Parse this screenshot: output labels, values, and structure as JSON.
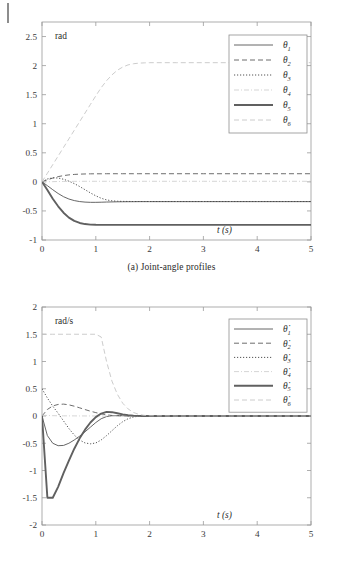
{
  "figure": {
    "panels": [
      {
        "id": "a",
        "caption": "(a) Joint-angle profiles",
        "unit_label": "rad",
        "x_axis_label": "t (s)",
        "y_ticks": [
          "2.5",
          "2",
          "1.5",
          "1",
          "0.5",
          "0",
          "-0.5",
          "-1"
        ],
        "x_ticks": [
          "0",
          "1",
          "2",
          "3",
          "4",
          "5"
        ],
        "legend": [
          {
            "label": "θ",
            "sub": "1",
            "style": "solid",
            "weight": "thin",
            "color": "#4d4d4d"
          },
          {
            "label": "θ",
            "sub": "2",
            "style": "dashed",
            "weight": "thin",
            "color": "#5a5a5a"
          },
          {
            "label": "θ",
            "sub": "3",
            "style": "dotted",
            "weight": "thin",
            "color": "#4a4a4a"
          },
          {
            "label": "θ",
            "sub": "4",
            "style": "dashdot",
            "weight": "thin",
            "color": "#c9c9c9"
          },
          {
            "label": "θ",
            "sub": "5",
            "style": "solid",
            "weight": "thick",
            "color": "#5e5e5e"
          },
          {
            "label": "θ",
            "sub": "6",
            "style": "dashed",
            "weight": "thin",
            "color": "#c4c4c4"
          }
        ]
      },
      {
        "id": "b",
        "caption": "(b) Joint-velocity profiles",
        "unit_label": "rad/s",
        "x_axis_label": "t (s)",
        "y_ticks": [
          "2",
          "1.5",
          "1",
          "0.5",
          "0",
          "-0.5",
          "-1",
          "-1.5",
          "-2"
        ],
        "x_ticks": [
          "0",
          "1",
          "2",
          "3",
          "4",
          "5"
        ],
        "legend": [
          {
            "label": "θ̇",
            "sub": "1",
            "style": "solid",
            "weight": "thin",
            "color": "#4d4d4d"
          },
          {
            "label": "θ̇",
            "sub": "2",
            "style": "dashed",
            "weight": "thin",
            "color": "#5a5a5a"
          },
          {
            "label": "θ̇",
            "sub": "3",
            "style": "dotted",
            "weight": "thin",
            "color": "#4a4a4a"
          },
          {
            "label": "θ̇",
            "sub": "4",
            "style": "dashdot",
            "weight": "thin",
            "color": "#c9c9c9"
          },
          {
            "label": "θ̇",
            "sub": "5",
            "style": "solid",
            "weight": "thick",
            "color": "#5e5e5e"
          },
          {
            "label": "θ̇",
            "sub": "6",
            "style": "dashed",
            "weight": "thin",
            "color": "#c4c4c4"
          }
        ]
      }
    ]
  },
  "chart_data": [
    {
      "type": "line",
      "title": "(a) Joint-angle profiles",
      "xlabel": "t (s)",
      "ylabel": "rad",
      "xlim": [
        0,
        5
      ],
      "ylim": [
        -1,
        2.75
      ],
      "grid": false,
      "legend_position": "upper-right",
      "x": [
        0,
        0.1,
        0.2,
        0.3,
        0.4,
        0.5,
        0.6,
        0.7,
        0.8,
        0.9,
        1.0,
        1.1,
        1.2,
        1.3,
        1.4,
        1.5,
        1.6,
        1.7,
        1.8,
        1.9,
        2.0,
        2.5,
        3.0,
        3.5,
        4.0,
        4.5,
        5.0
      ],
      "series": [
        {
          "name": "θ1",
          "style": "solid",
          "values": [
            0,
            -0.065,
            -0.135,
            -0.2,
            -0.255,
            -0.295,
            -0.322,
            -0.339,
            -0.348,
            -0.352,
            -0.352,
            -0.35,
            -0.347,
            -0.345,
            -0.343,
            -0.342,
            -0.341,
            -0.341,
            -0.34,
            -0.34,
            -0.34,
            -0.34,
            -0.34,
            -0.34,
            -0.34,
            -0.34,
            -0.34
          ]
        },
        {
          "name": "θ2",
          "style": "dashed",
          "values": [
            0,
            0.035,
            0.065,
            0.09,
            0.108,
            0.12,
            0.128,
            0.133,
            0.136,
            0.138,
            0.139,
            0.139,
            0.14,
            0.14,
            0.14,
            0.14,
            0.14,
            0.14,
            0.14,
            0.14,
            0.14,
            0.14,
            0.14,
            0.14,
            0.14,
            0.14,
            0.14
          ]
        },
        {
          "name": "θ3",
          "style": "dotted",
          "values": [
            0,
            0.05,
            0.07,
            0.066,
            0.045,
            0.012,
            -0.03,
            -0.08,
            -0.135,
            -0.19,
            -0.24,
            -0.282,
            -0.31,
            -0.326,
            -0.333,
            -0.336,
            -0.337,
            -0.338,
            -0.338,
            -0.338,
            -0.338,
            -0.338,
            -0.338,
            -0.338,
            -0.338,
            -0.338,
            -0.338
          ]
        },
        {
          "name": "θ4",
          "style": "dashdot",
          "values": [
            0,
            0.002,
            0.004,
            0.006,
            0.007,
            0.008,
            0.009,
            0.009,
            0.01,
            0.01,
            0.01,
            0.01,
            0.01,
            0.01,
            0.01,
            0.01,
            0.01,
            0.01,
            0.01,
            0.01,
            0.01,
            0.01,
            0.01,
            0.01,
            0.01,
            0.01,
            0.01
          ]
        },
        {
          "name": "θ5",
          "style": "solid-thick",
          "values": [
            0,
            -0.14,
            -0.29,
            -0.42,
            -0.53,
            -0.615,
            -0.672,
            -0.707,
            -0.726,
            -0.735,
            -0.738,
            -0.739,
            -0.739,
            -0.739,
            -0.739,
            -0.739,
            -0.739,
            -0.739,
            -0.739,
            -0.739,
            -0.739,
            -0.739,
            -0.739,
            -0.739,
            -0.739,
            -0.739,
            -0.739
          ]
        },
        {
          "name": "θ6",
          "style": "dashed-light",
          "values": [
            0,
            0.148,
            0.296,
            0.444,
            0.592,
            0.74,
            0.888,
            1.036,
            1.184,
            1.332,
            1.48,
            1.62,
            1.74,
            1.84,
            1.92,
            1.975,
            2.012,
            2.032,
            2.042,
            2.047,
            2.05,
            2.05,
            2.05,
            2.05,
            2.05,
            2.05,
            2.05
          ]
        }
      ]
    },
    {
      "type": "line",
      "title": "(b) Joint-velocity profiles",
      "xlabel": "t (s)",
      "ylabel": "rad/s",
      "xlim": [
        0,
        5
      ],
      "ylim": [
        -2,
        2
      ],
      "grid": false,
      "legend_position": "upper-right",
      "x": [
        0,
        0.1,
        0.2,
        0.3,
        0.4,
        0.5,
        0.6,
        0.7,
        0.8,
        0.9,
        1.0,
        1.1,
        1.2,
        1.3,
        1.4,
        1.5,
        1.6,
        1.7,
        1.8,
        1.9,
        2.0,
        2.5,
        3.0,
        3.5,
        4.0,
        4.5,
        5.0
      ],
      "series": [
        {
          "name": "θ̇1",
          "style": "solid",
          "values": [
            0,
            -0.36,
            -0.5,
            -0.545,
            -0.54,
            -0.5,
            -0.44,
            -0.37,
            -0.29,
            -0.205,
            -0.12,
            -0.05,
            -0.01,
            0.005,
            0.008,
            0.006,
            0.004,
            0.002,
            0.001,
            0.0,
            0.0,
            0.0,
            0.0,
            0.0,
            0.0,
            0.0,
            0.0
          ]
        },
        {
          "name": "θ̇2",
          "style": "dashed",
          "values": [
            0,
            0.12,
            0.185,
            0.212,
            0.218,
            0.205,
            0.18,
            0.15,
            0.118,
            0.088,
            0.062,
            0.04,
            0.022,
            0.01,
            0.004,
            0.001,
            0.0,
            0.0,
            0.0,
            0.0,
            0.0,
            0.0,
            0.0,
            0.0,
            0.0,
            0.0,
            0.0
          ]
        },
        {
          "name": "θ̇3",
          "style": "dotted",
          "values": [
            0.5,
            0.33,
            0.18,
            0.05,
            -0.09,
            -0.23,
            -0.35,
            -0.44,
            -0.495,
            -0.51,
            -0.495,
            -0.44,
            -0.36,
            -0.27,
            -0.18,
            -0.105,
            -0.05,
            -0.018,
            -0.004,
            0.0,
            0.0,
            0.0,
            0.0,
            0.0,
            0.0,
            0.0,
            0.0
          ]
        },
        {
          "name": "θ̇4",
          "style": "dashdot",
          "values": [
            0.015,
            0.01,
            0.006,
            0.004,
            0.003,
            0.002,
            0.002,
            0.001,
            0.001,
            0.001,
            0.0,
            0.0,
            0.0,
            0.0,
            0.0,
            0.0,
            0.0,
            0.0,
            0.0,
            0.0,
            0.0,
            0.0,
            0.0,
            0.0,
            0.0,
            0.0,
            0.0
          ]
        },
        {
          "name": "θ̇5",
          "style": "solid-thick",
          "values": [
            0,
            -1.5,
            -1.5,
            -1.3,
            -1.05,
            -0.82,
            -0.6,
            -0.41,
            -0.25,
            -0.12,
            -0.02,
            0.045,
            0.075,
            0.07,
            0.05,
            0.03,
            0.015,
            0.006,
            0.002,
            0.0,
            0.0,
            0.0,
            0.0,
            0.0,
            0.0,
            0.0,
            0.0
          ]
        },
        {
          "name": "θ̇6",
          "style": "dashed-light",
          "values": [
            1.5,
            1.5,
            1.5,
            1.5,
            1.5,
            1.5,
            1.5,
            1.5,
            1.5,
            1.5,
            1.5,
            1.45,
            1.0,
            0.64,
            0.4,
            0.235,
            0.13,
            0.065,
            0.03,
            0.012,
            0.004,
            0.0,
            0.0,
            0.0,
            0.0,
            0.0,
            0.0
          ]
        }
      ]
    }
  ]
}
